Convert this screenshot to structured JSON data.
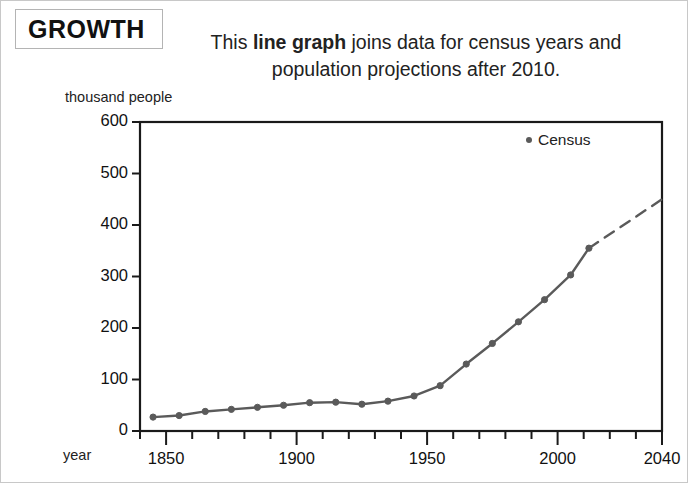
{
  "title": {
    "text": "GROWTH"
  },
  "caption": {
    "pre": "This ",
    "bold": "line graph",
    "post": " joins data for census years and population projections after 2010."
  },
  "legend": {
    "label": "Census",
    "marker_color": "#5a5a5a"
  },
  "axis": {
    "y_unit_label": "thousand people",
    "x_unit_label": "year"
  },
  "chart_data": {
    "type": "line",
    "title": "GROWTH",
    "subtitle": "This line graph joins data for census years and population projections after 2010.",
    "xlabel": "year",
    "ylabel": "thousand people",
    "xlim": [
      1840,
      2040
    ],
    "ylim": [
      0,
      600
    ],
    "yticks": [
      0,
      100,
      200,
      300,
      400,
      500,
      600
    ],
    "ytick_labels": [
      "0",
      "100",
      "200",
      "300",
      "400",
      "500",
      "600"
    ],
    "xticks": [
      1840,
      1850,
      1860,
      1870,
      1880,
      1890,
      1900,
      1910,
      1920,
      1930,
      1940,
      1950,
      1960,
      1970,
      1980,
      1990,
      2000,
      2010,
      2020,
      2030,
      2040
    ],
    "xtick_labels_shown": [
      "1850",
      "1900",
      "1950",
      "2000",
      "2040"
    ],
    "xtick_label_values": [
      1850,
      1900,
      1950,
      2000,
      2040
    ],
    "grid": false,
    "legend_position": "top-right",
    "line_color": "#5a5a5a",
    "marker": "circle",
    "series": [
      {
        "name": "Census",
        "style": "solid",
        "x": [
          1845,
          1855,
          1865,
          1875,
          1885,
          1895,
          1905,
          1915,
          1925,
          1935,
          1945,
          1955,
          1965,
          1975,
          1985,
          1995,
          2005,
          2012
        ],
        "values": [
          27,
          30,
          38,
          42,
          46,
          50,
          55,
          56,
          52,
          58,
          68,
          88,
          130,
          170,
          212,
          255,
          303,
          355
        ]
      },
      {
        "name": "Projection",
        "style": "dashed",
        "x": [
          2012,
          2040
        ],
        "values": [
          355,
          450
        ]
      }
    ]
  }
}
